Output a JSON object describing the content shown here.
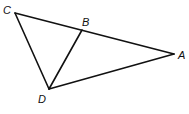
{
  "diagram": {
    "type": "geometry-triangle",
    "points": {
      "A": {
        "label": "A",
        "x": 174,
        "y": 54
      },
      "B": {
        "label": "B",
        "x": 82,
        "y": 30
      },
      "C": {
        "label": "C",
        "x": 15,
        "y": 13
      },
      "D": {
        "label": "D",
        "x": 49,
        "y": 89
      }
    },
    "segments": [
      [
        "C",
        "A"
      ],
      [
        "C",
        "D"
      ],
      [
        "D",
        "A"
      ],
      [
        "D",
        "B"
      ]
    ],
    "stroke_color": "#111111"
  }
}
